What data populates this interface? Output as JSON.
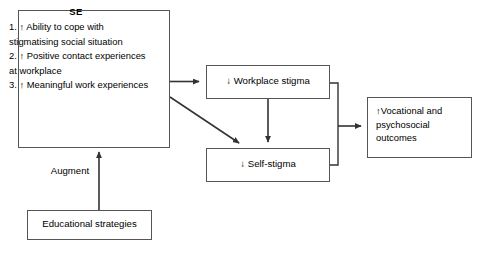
{
  "diagram": {
    "type": "flow-diagram",
    "background_color": "#ffffff",
    "line_color": "#555555",
    "text_color": "#000000",
    "nodes": {
      "se": {
        "title": "SE",
        "items": "1. ↑ Ability to cope with stigmatising social situation\n2. ↑ Positive contact experiences at workplace\n3. ↑ Meaningful work experiences"
      },
      "workplace_stigma": {
        "label": "↓ Workplace stigma"
      },
      "self_stigma": {
        "label": "↓ Self-stigma"
      },
      "outcomes": {
        "label": "↑Vocational and psychosocial outcomes"
      },
      "educational_strategies": {
        "label": "Educational strategies"
      }
    },
    "edges": [
      {
        "name": "se-to-workplace-stigma",
        "from": "se",
        "to": "workplace_stigma",
        "label": "",
        "style": "solid-arrow"
      },
      {
        "name": "se-to-self-stigma",
        "from": "se",
        "to": "self_stigma",
        "label": "",
        "style": "solid-arrow-diagonal"
      },
      {
        "name": "workplace-stigma-to-self-stigma",
        "from": "workplace_stigma",
        "to": "self_stigma",
        "label": "",
        "style": "solid-arrow-vertical"
      },
      {
        "name": "stigma-to-outcomes",
        "from": "workplace_stigma,self_stigma",
        "to": "outcomes",
        "label": "",
        "style": "bracket-arrow"
      },
      {
        "name": "educational-strategies-to-se",
        "from": "educational_strategies",
        "to": "se",
        "label": "Augment",
        "style": "solid-arrow-vertical"
      }
    ]
  }
}
